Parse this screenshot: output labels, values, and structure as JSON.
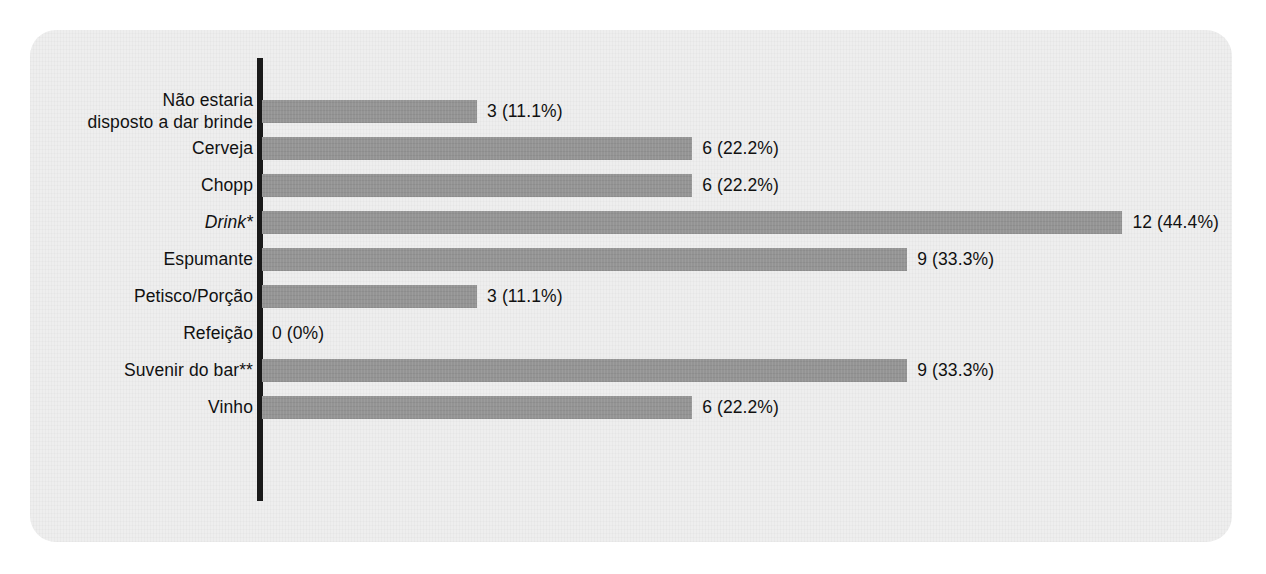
{
  "chart_data": {
    "type": "bar",
    "orientation": "horizontal",
    "title": "",
    "subtitle": "",
    "xlabel": "",
    "ylabel": "",
    "grid": false,
    "legend": null,
    "total_respondents": 27,
    "axis": {
      "category_axis": "y",
      "value_axis": "x",
      "xlim": [
        0,
        12
      ],
      "value_axis_visible": false,
      "tick_labels": []
    },
    "categories": [
      "Não estaria\ndisposto a dar brinde",
      "Cerveja",
      "Chopp",
      "Drink*",
      "Espumante",
      "Petisco/Porção",
      "Refeição",
      "Suvenir do bar**",
      "Vinho"
    ],
    "values": [
      3,
      6,
      6,
      12,
      9,
      3,
      0,
      9,
      6
    ],
    "percents": [
      11.1,
      22.2,
      22.2,
      44.4,
      33.3,
      11.1,
      0,
      33.3,
      22.2
    ],
    "data_labels": [
      "3 (11.1%)",
      "6 (22.2%)",
      "6 (22.2%)",
      "12 (44.4%)",
      "9 (33.3%)",
      "3 (11.1%)",
      "0 (0%)",
      "9 (33.3%)",
      "6 (22.2%)"
    ],
    "italic_categories": [
      "Drink*"
    ],
    "colors": {
      "bar": "#949494",
      "axis": "#1a1a1a",
      "text": "#111111",
      "panel_background": "#eeeeee",
      "page_background": "#ffffff"
    }
  },
  "rows": [
    {
      "label": "Não estaria\ndisposto a dar brinde",
      "value": 3,
      "data_label": "3 (11.1%)",
      "italic": false
    },
    {
      "label": "Cerveja",
      "value": 6,
      "data_label": "6 (22.2%)",
      "italic": false
    },
    {
      "label": "Chopp",
      "value": 6,
      "data_label": "6 (22.2%)",
      "italic": false
    },
    {
      "label": "Drink*",
      "value": 12,
      "data_label": "12 (44.4%)",
      "italic": true
    },
    {
      "label": "Espumante",
      "value": 9,
      "data_label": "9 (33.3%)",
      "italic": false
    },
    {
      "label": "Petisco/Porção",
      "value": 3,
      "data_label": "3 (11.1%)",
      "italic": false
    },
    {
      "label": "Refeição",
      "value": 0,
      "data_label": "0 (0%)",
      "italic": false
    },
    {
      "label": "Suvenir do bar**",
      "value": 9,
      "data_label": "9 (33.3%)",
      "italic": false
    },
    {
      "label": "Vinho",
      "value": 6,
      "data_label": "6 (22.2%)",
      "italic": false
    }
  ]
}
